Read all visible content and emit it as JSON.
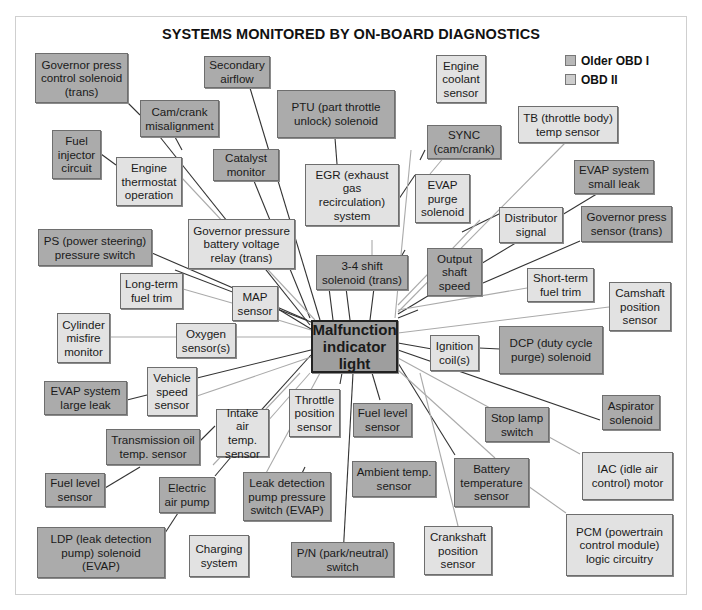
{
  "title": "SYSTEMS MONITORED BY ON-BOARD DIAGNOSTICS",
  "legend": [
    {
      "label": "Older OBD I",
      "color": "#b8b8b8"
    },
    {
      "label": "OBD II",
      "color": "#cdcdcd"
    }
  ],
  "center": {
    "label": "Malfunction indicator light"
  },
  "colors": {
    "dark_box": "#ababab",
    "light_box": "#e2e2e2",
    "center_box": "#9e9e9e"
  },
  "boxes": [
    {
      "id": "governor-press-control-solenoid",
      "label": "Governor press control solenoid (trans)",
      "tone": "dark"
    },
    {
      "id": "secondary-airflow",
      "label": "Secondary airflow",
      "tone": "dark"
    },
    {
      "id": "ptu",
      "label": "PTU (part throttle unlock) solenoid",
      "tone": "dark"
    },
    {
      "id": "engine-coolant-sensor",
      "label": "Engine coolant sensor",
      "tone": "light"
    },
    {
      "id": "cam-crank-misalignment",
      "label": "Cam/crank misalignment",
      "tone": "dark"
    },
    {
      "id": "sync",
      "label": "SYNC (cam/crank)",
      "tone": "dark"
    },
    {
      "id": "tb-temp-sensor",
      "label": "TB (throttle body) temp sensor",
      "tone": "light"
    },
    {
      "id": "fuel-injector-circuit",
      "label": "Fuel injector circuit",
      "tone": "dark"
    },
    {
      "id": "engine-thermostat",
      "label": "Engine thermostat operation",
      "tone": "light"
    },
    {
      "id": "catalyst-monitor",
      "label": "Catalyst monitor",
      "tone": "dark"
    },
    {
      "id": "egr",
      "label": "EGR (exhaust gas recirculation) system",
      "tone": "light"
    },
    {
      "id": "evap-purge-solenoid",
      "label": "EVAP purge solenoid",
      "tone": "light"
    },
    {
      "id": "evap-small-leak",
      "label": "EVAP system small leak",
      "tone": "dark"
    },
    {
      "id": "distributor-signal",
      "label": "Distributor signal",
      "tone": "light"
    },
    {
      "id": "governor-press-sensor",
      "label": "Governor press sensor (trans)",
      "tone": "dark"
    },
    {
      "id": "ps-pressure-switch",
      "label": "PS (power steering) pressure switch",
      "tone": "dark"
    },
    {
      "id": "governor-pressure-battery",
      "label": "Governor pressure battery voltage relay (trans)",
      "tone": "light"
    },
    {
      "id": "shift-solenoid-34",
      "label": "3-4 shift solenoid (trans)",
      "tone": "dark"
    },
    {
      "id": "output-shaft-speed",
      "label": "Output shaft speed",
      "tone": "dark"
    },
    {
      "id": "long-term-fuel-trim",
      "label": "Long-term fuel trim",
      "tone": "light"
    },
    {
      "id": "map-sensor",
      "label": "MAP sensor",
      "tone": "light"
    },
    {
      "id": "short-term-fuel-trim",
      "label": "Short-term fuel trim",
      "tone": "light"
    },
    {
      "id": "camshaft-position-sensor",
      "label": "Camshaft position sensor",
      "tone": "light"
    },
    {
      "id": "cylinder-misfire",
      "label": "Cylinder misfire monitor",
      "tone": "light"
    },
    {
      "id": "oxygen-sensors",
      "label": "Oxygen sensor(s)",
      "tone": "light"
    },
    {
      "id": "ignition-coils",
      "label": "Ignition coil(s)",
      "tone": "light"
    },
    {
      "id": "dcp",
      "label": "DCP (duty cycle purge) solenoid",
      "tone": "dark"
    },
    {
      "id": "evap-large-leak",
      "label": "EVAP system large leak",
      "tone": "dark"
    },
    {
      "id": "vehicle-speed-sensor",
      "label": "Vehicle speed sensor",
      "tone": "light"
    },
    {
      "id": "throttle-position-sensor",
      "label": "Throttle position sensor",
      "tone": "light"
    },
    {
      "id": "fuel-level-sensor-center",
      "label": "Fuel level sensor",
      "tone": "dark"
    },
    {
      "id": "aspirator-solenoid",
      "label": "Aspirator solenoid",
      "tone": "dark"
    },
    {
      "id": "transmission-oil-temp",
      "label": "Transmission oil temp. sensor",
      "tone": "dark"
    },
    {
      "id": "intake-air-temp",
      "label": "Intake air temp. sensor",
      "tone": "light"
    },
    {
      "id": "stop-lamp-switch",
      "label": "Stop lamp switch",
      "tone": "dark"
    },
    {
      "id": "fuel-level-sensor-left",
      "label": "Fuel level sensor",
      "tone": "dark"
    },
    {
      "id": "electric-air-pump",
      "label": "Electric air pump",
      "tone": "dark"
    },
    {
      "id": "leak-detection-pump-switch",
      "label": "Leak detection pump pressure switch (EVAP)",
      "tone": "dark"
    },
    {
      "id": "ambient-temp-sensor",
      "label": "Ambient temp. sensor",
      "tone": "dark"
    },
    {
      "id": "battery-temp-sensor",
      "label": "Battery temperature sensor",
      "tone": "dark"
    },
    {
      "id": "iac",
      "label": "IAC (idle air control) motor",
      "tone": "light"
    },
    {
      "id": "ldp",
      "label": "LDP (leak detection pump) solenoid (EVAP)",
      "tone": "dark"
    },
    {
      "id": "charging-system",
      "label": "Charging system",
      "tone": "light"
    },
    {
      "id": "pn-switch",
      "label": "P/N (park/neutral) switch",
      "tone": "dark"
    },
    {
      "id": "crankshaft-position-sensor",
      "label": "Crankshaft position sensor",
      "tone": "light"
    },
    {
      "id": "pcm",
      "label": "PCM (powertrain control module) logic circuitry",
      "tone": "light"
    }
  ]
}
